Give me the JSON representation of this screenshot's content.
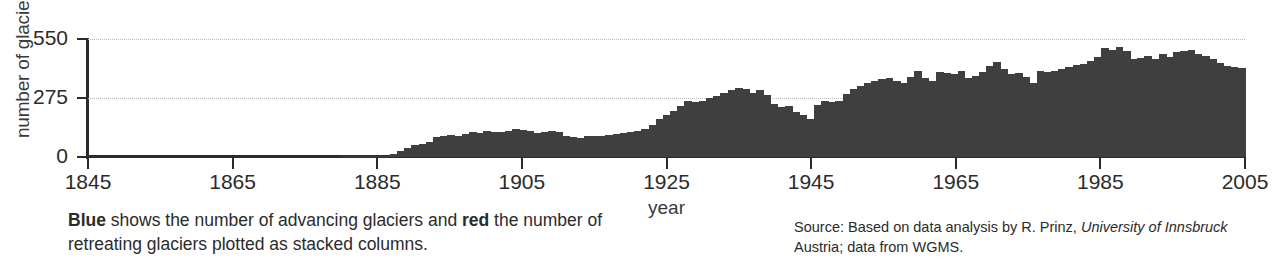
{
  "axes": {
    "ylabel": "number of glaciers",
    "xlabel": "year",
    "yticks": [
      "550",
      "275",
      "0"
    ],
    "xticks": [
      "1845",
      "1865",
      "1885",
      "1905",
      "1925",
      "1945",
      "1965",
      "1985",
      "2005"
    ]
  },
  "caption": {
    "bold_1": "Blue",
    "text_1": " shows the number of advancing glaciers and ",
    "bold_2": "red",
    "text_2": " the number of retreating glaciers plotted as stacked columns."
  },
  "source": {
    "lead": "Source: Based on data analysis by R. Prinz, ",
    "italic": "University of Innsbruck",
    "tail": " Austria; data from WGMS."
  },
  "colors": {
    "bar": "#3f3f3f",
    "axis": "#2b2b2b",
    "grid": "#b9b9b9",
    "text": "#2b2b2b"
  },
  "chart_data": {
    "type": "bar",
    "title": "",
    "xlabel": "year",
    "ylabel": "number of glaciers",
    "xlim": [
      1845,
      2005
    ],
    "ylim": [
      0,
      550
    ],
    "yticks": [
      0,
      275,
      550
    ],
    "xticks": [
      1845,
      1865,
      1885,
      1905,
      1925,
      1945,
      1965,
      1985,
      2005
    ],
    "grid": true,
    "legend": "none",
    "x": [
      1845,
      1846,
      1847,
      1848,
      1849,
      1850,
      1851,
      1852,
      1853,
      1854,
      1855,
      1856,
      1857,
      1858,
      1859,
      1860,
      1861,
      1862,
      1863,
      1864,
      1865,
      1866,
      1867,
      1868,
      1869,
      1870,
      1871,
      1872,
      1873,
      1874,
      1875,
      1876,
      1877,
      1878,
      1879,
      1880,
      1881,
      1882,
      1883,
      1884,
      1885,
      1886,
      1887,
      1888,
      1889,
      1890,
      1891,
      1892,
      1893,
      1894,
      1895,
      1896,
      1897,
      1898,
      1899,
      1900,
      1901,
      1902,
      1903,
      1904,
      1905,
      1906,
      1907,
      1908,
      1909,
      1910,
      1911,
      1912,
      1913,
      1914,
      1915,
      1916,
      1917,
      1918,
      1919,
      1920,
      1921,
      1922,
      1923,
      1924,
      1925,
      1926,
      1927,
      1928,
      1929,
      1930,
      1931,
      1932,
      1933,
      1934,
      1935,
      1936,
      1937,
      1938,
      1939,
      1940,
      1941,
      1942,
      1943,
      1944,
      1945,
      1946,
      1947,
      1948,
      1949,
      1950,
      1951,
      1952,
      1953,
      1954,
      1955,
      1956,
      1957,
      1958,
      1959,
      1960,
      1961,
      1962,
      1963,
      1964,
      1965,
      1966,
      1967,
      1968,
      1969,
      1970,
      1971,
      1972,
      1973,
      1974,
      1975,
      1976,
      1977,
      1978,
      1979,
      1980,
      1981,
      1982,
      1983,
      1984,
      1985,
      1986,
      1987,
      1988,
      1989,
      1990,
      1991,
      1992,
      1993,
      1994,
      1995,
      1996,
      1997,
      1998,
      1999,
      2000,
      2001,
      2002,
      2003,
      2004,
      2005
    ],
    "values": [
      0,
      0,
      0,
      0,
      0,
      0,
      0,
      0,
      0,
      0,
      0,
      0,
      0,
      0,
      0,
      0,
      0,
      0,
      0,
      0,
      0,
      0,
      0,
      0,
      0,
      0,
      0,
      0,
      0,
      0,
      0,
      0,
      0,
      0,
      0,
      4,
      4,
      4,
      4,
      5,
      5,
      6,
      14,
      30,
      42,
      55,
      62,
      70,
      95,
      100,
      102,
      100,
      108,
      118,
      112,
      120,
      118,
      115,
      122,
      130,
      128,
      120,
      112,
      118,
      122,
      118,
      96,
      92,
      90,
      96,
      98,
      100,
      104,
      106,
      110,
      118,
      122,
      130,
      150,
      178,
      196,
      215,
      238,
      262,
      258,
      262,
      275,
      286,
      300,
      312,
      322,
      318,
      300,
      312,
      290,
      248,
      232,
      236,
      212,
      196,
      178,
      242,
      262,
      255,
      262,
      295,
      318,
      330,
      345,
      352,
      362,
      368,
      352,
      345,
      375,
      400,
      370,
      355,
      398,
      392,
      388,
      402,
      370,
      378,
      395,
      425,
      442,
      412,
      386,
      390,
      372,
      345,
      400,
      398,
      402,
      412,
      418,
      430,
      435,
      448,
      468,
      508,
      500,
      512,
      492,
      455,
      462,
      470,
      455,
      478,
      465,
      488,
      492,
      498,
      482,
      470,
      455,
      440,
      425,
      418,
      415
    ]
  }
}
